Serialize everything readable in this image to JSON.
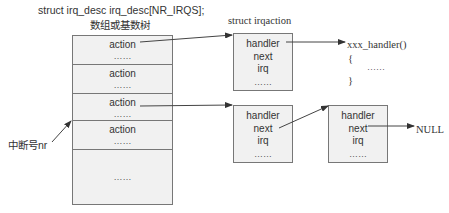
{
  "array": {
    "title_line1": "struct irq_desc irq_desc[NR_IRQS];",
    "title_line2": "数组或基数树",
    "cells": [
      {
        "label": "action",
        "dots": "……"
      },
      {
        "label": "action",
        "dots": "……"
      },
      {
        "label": "action",
        "dots": "……"
      },
      {
        "label": "action",
        "dots": "……"
      },
      {
        "label": "",
        "dots": "……"
      }
    ]
  },
  "index_label": "中断号nr",
  "irqaction_title": "struct irqaction",
  "nodes": [
    {
      "fields": [
        "handler",
        "next",
        "irq",
        "……"
      ]
    },
    {
      "fields": [
        "handler",
        "next",
        "irq",
        "……"
      ]
    },
    {
      "fields": [
        "handler",
        "next",
        "irq",
        "……"
      ]
    }
  ],
  "handler_code": {
    "signature": "xxx_handler()",
    "open": "{",
    "body": "……",
    "close": "}"
  },
  "null_label": "NULL"
}
